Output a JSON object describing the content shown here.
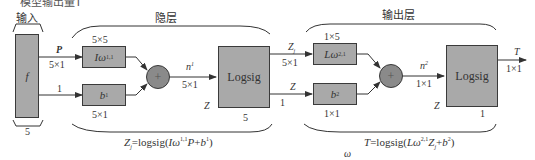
{
  "top_caption_cut": "模型输出量T",
  "layers": {
    "input": {
      "title": "输入",
      "block": "f",
      "size": "5"
    },
    "hidden": {
      "title": "隐层",
      "size": "5"
    },
    "output": {
      "title": "输出层",
      "size": "1"
    }
  },
  "input_signals": {
    "p_label": "P",
    "p_dim": "5×1",
    "bias_input": "1"
  },
  "hidden_layer": {
    "weight_box": {
      "label": "Iω",
      "sup": "1,1",
      "dim_top": "5×5"
    },
    "bias_box": {
      "label": "b",
      "sup": "1",
      "dim_bottom": "5×1"
    },
    "sum_symbol": "+",
    "net_label": "n",
    "net_sup": "1",
    "net_dim": "5×1",
    "transfer": "Logsig",
    "z_label": "Z",
    "formula": "Zj=logsig(Iω1,1P+b1)"
  },
  "output_signals": {
    "z_label": "Z",
    "z_sub": "j",
    "z_dim": "5×1",
    "bias_input": "1",
    "z_lower": "Z"
  },
  "output_layer": {
    "weight_box": {
      "label": "Lω",
      "sup": "2,1",
      "dim_top": "1×5"
    },
    "bias_box": {
      "label": "b",
      "sup": "2",
      "dim_bottom": "1×1"
    },
    "sum_symbol": "+",
    "net_label": "n",
    "net_sup": "2",
    "net_dim": "1×1",
    "transfer": "Logsig",
    "z_label": "Z",
    "out_label": "T",
    "out_dim": "1×1",
    "formula": "T=logsig(Lω2,1Zj+b2)"
  },
  "footer_symbol": "ω",
  "colors": {
    "box_fill": "#a9a9a9",
    "circle_fill": "#8a8a8a",
    "stroke": "#3a3a3a",
    "text": "#333333"
  }
}
